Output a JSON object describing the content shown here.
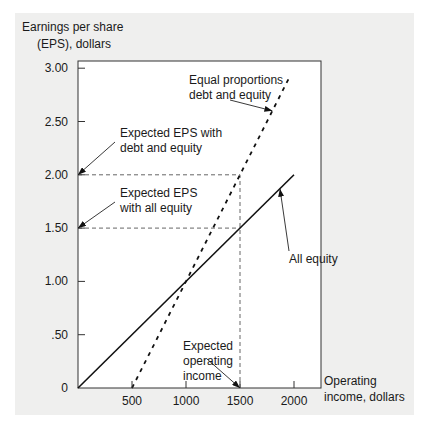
{
  "chart_data": {
    "type": "line",
    "title": "",
    "ylabel": [
      "Earnings per share",
      "(EPS), dollars"
    ],
    "xlabel": [
      "Operating",
      "income, dollars"
    ],
    "xlim": [
      0,
      2200
    ],
    "ylim": [
      0,
      3.1
    ],
    "x_ticks": [
      500,
      1000,
      1500,
      2000
    ],
    "x_tick_labels": [
      "500",
      "1000",
      "1500",
      "2000"
    ],
    "y_ticks": [
      0,
      0.5,
      1.0,
      1.5,
      2.0,
      2.5,
      3.0
    ],
    "y_tick_labels": [
      "0",
      ".50",
      "1.00",
      "1.50",
      "2.00",
      "2.50",
      "3.00"
    ],
    "grid": false,
    "series": [
      {
        "name": "All equity",
        "style": "solid",
        "x": [
          0,
          2000
        ],
        "y": [
          0,
          2.0
        ]
      },
      {
        "name": "Equal proportions debt and equity",
        "style": "dashed",
        "x": [
          500,
          1950
        ],
        "y": [
          0,
          2.9
        ]
      }
    ],
    "reference_lines": [
      {
        "name": "expected-eps-debt-equity",
        "type": "horizontal",
        "y": 2.0,
        "x_from": 0,
        "x_to": 1500
      },
      {
        "name": "expected-eps-all-equity",
        "type": "horizontal",
        "y": 1.5,
        "x_from": 0,
        "x_to": 1500
      },
      {
        "name": "expected-operating-income",
        "type": "vertical",
        "x": 1500,
        "y_from": 0,
        "y_to": 2.0
      }
    ],
    "annotations": [
      {
        "name": "equal-proportions",
        "lines": [
          "Equal proportions",
          "debt and equity"
        ],
        "arrow_to": [
          1800,
          2.6
        ]
      },
      {
        "name": "expected-eps-debt-equity",
        "lines": [
          "Expected EPS with",
          "debt and equity"
        ],
        "arrow_to": [
          0,
          2.0
        ]
      },
      {
        "name": "expected-eps-all-equity",
        "lines": [
          "Expected EPS",
          "with all equity"
        ],
        "arrow_to": [
          0,
          1.5
        ]
      },
      {
        "name": "all-equity",
        "lines": [
          "All equity"
        ],
        "arrow_to": [
          1870,
          1.87
        ]
      },
      {
        "name": "expected-operating-income",
        "lines": [
          "Expected",
          "operating",
          "income"
        ],
        "arrow_to": [
          1500,
          0
        ]
      }
    ]
  }
}
